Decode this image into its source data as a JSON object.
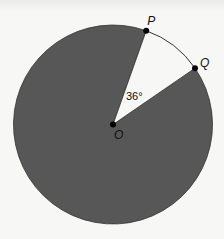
{
  "diagram": {
    "type": "circle-sector",
    "shaded_region": "major sector",
    "unshaded_region": "minor sector POQ",
    "central_angle_degrees": 36,
    "colors": {
      "shaded_fill": "#575757",
      "outline": "#333333",
      "background": "#f7f7f5",
      "point": "#000000"
    },
    "points": {
      "center": "O",
      "p": "P",
      "q": "Q"
    },
    "angle_label": "36°"
  }
}
